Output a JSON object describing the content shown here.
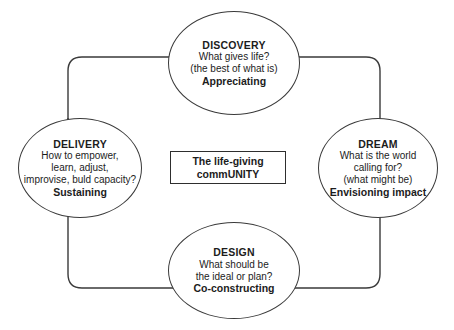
{
  "diagram": {
    "type": "cycle",
    "stroke_color": "#3a3a3a",
    "text_color": "#1c1c1c",
    "background_color": "#ffffff",
    "center": {
      "line1": "The life-giving",
      "line2": "commUNITY"
    },
    "nodes": [
      {
        "id": "discovery",
        "title": "DISCOVERY",
        "question_line1": "What gives life?",
        "question_line2": "(the best of what is)",
        "role": "Appreciating"
      },
      {
        "id": "dream",
        "title": "DREAM",
        "question_line1": "What is the world",
        "question_line2": "calling for?",
        "question_line3": "(what might be)",
        "role": "Envisioning impact"
      },
      {
        "id": "design",
        "title": "DESIGN",
        "question_line1": "What should be",
        "question_line2": "the ideal or plan?",
        "role": "Co-constructing"
      },
      {
        "id": "delivery",
        "title": "DELIVERY",
        "question_line1": "How to empower,",
        "question_line2": "learn, adjust,",
        "question_line3": "improvise, buld capacity?",
        "role": "Sustaining"
      }
    ]
  }
}
